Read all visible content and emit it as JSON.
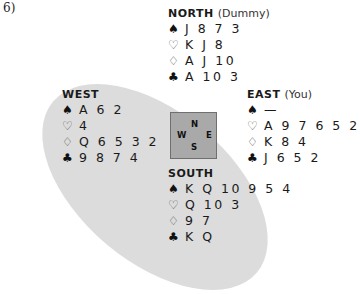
{
  "problem_number": "6)",
  "suit_symbols": {
    "spades": "♠",
    "hearts": "♡",
    "diamonds": "♢",
    "clubs": "♣"
  },
  "compass": {
    "north": "N",
    "west": "W",
    "east": "E",
    "south": "S"
  },
  "colors": {
    "ellipse": "#dcdcdc",
    "compass_box": "#a9a9a9",
    "text": "#1a1a1a"
  },
  "hands": {
    "north": {
      "name": "NORTH",
      "role": "(Dummy)",
      "spades": "J 8 7 3",
      "hearts": "K J 8",
      "diamonds": "A J 10",
      "clubs": "A 10 3"
    },
    "west": {
      "name": "WEST",
      "role": "",
      "spades": "A 6 2",
      "hearts": "4",
      "diamonds": "Q 6 5 3 2",
      "clubs": "9 8 7 4"
    },
    "east": {
      "name": "EAST",
      "role": "(You)",
      "spades": "—",
      "hearts": "A 9 7 6 5 2",
      "diamonds": "K 8 4",
      "clubs": "J 6 5 2"
    },
    "south": {
      "name": "SOUTH",
      "role": "",
      "spades": "K Q 10 9 5 4",
      "hearts": "Q 10 3",
      "diamonds": "9 7",
      "clubs": "K Q"
    }
  }
}
